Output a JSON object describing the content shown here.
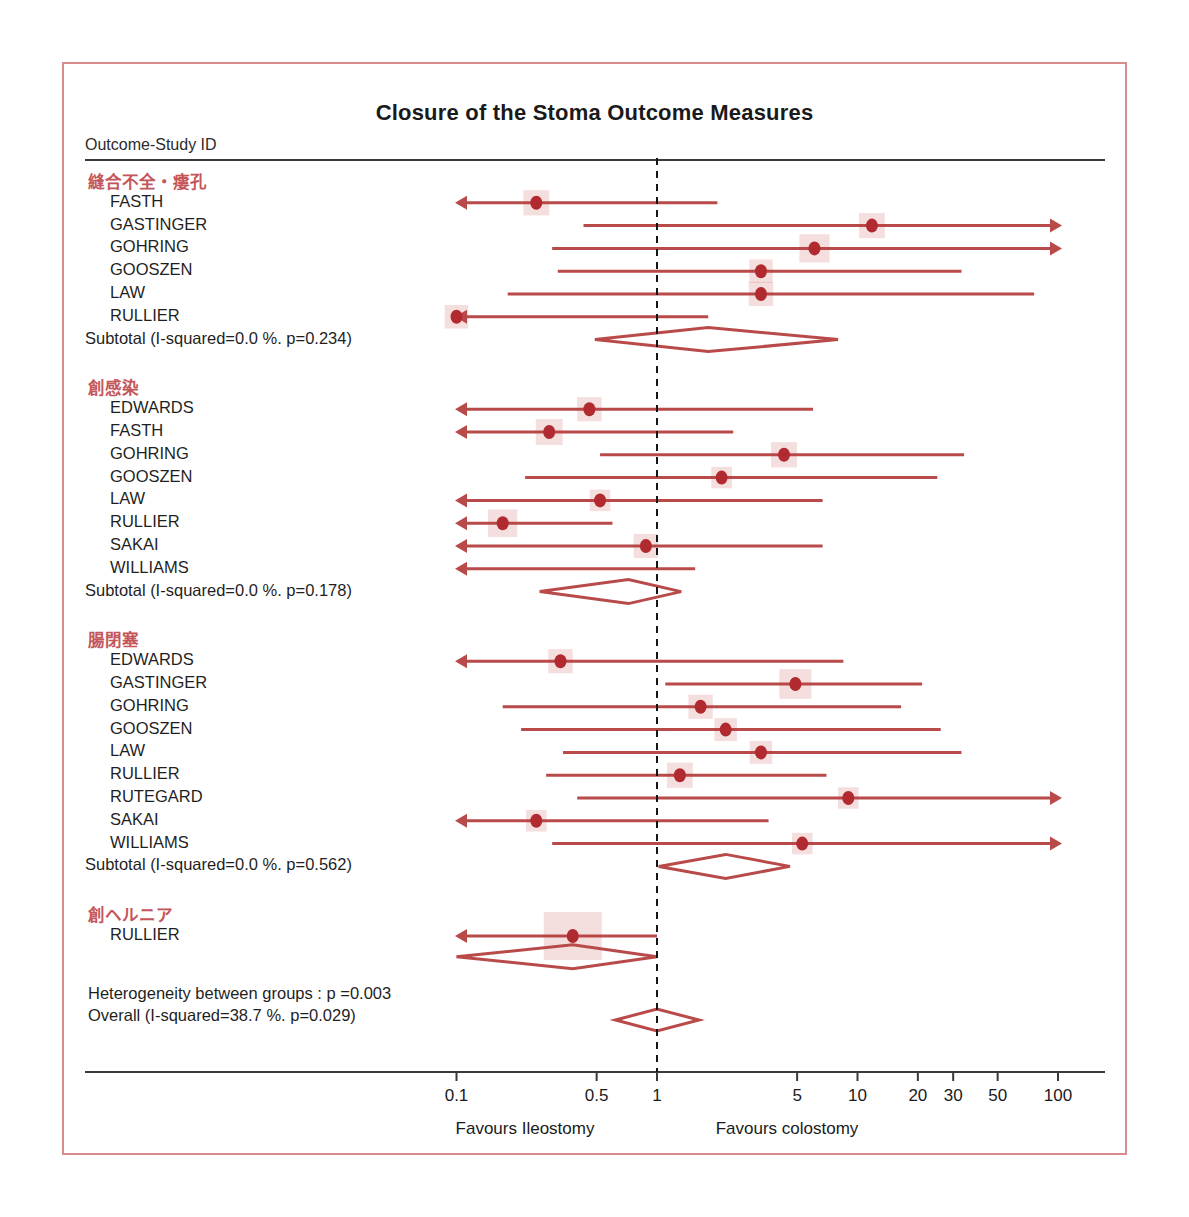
{
  "figure": {
    "title": "Closure of the Stoma Outcome Measures",
    "column_header": "Outcome-Study ID",
    "heterogeneity_note": "Heterogeneity between groups : p =0.003",
    "overall_label": "Overall (I-squared=38.7 %. p=0.029)",
    "favours_left": "Favours Ileostomy",
    "favours_right": "Favours colostomy",
    "accent_color": "#b94a4a",
    "marker_color": "#b02a30",
    "group_heading_color": "#c4565a",
    "frame_color": "#d98c8c"
  },
  "chart_data": {
    "type": "forest",
    "title": "Closure of the Stoma Outcome Measures",
    "xlabel": "Odds ratio (log scale)",
    "ylabel": "Outcome-Study ID",
    "scale": "log10",
    "xlim": [
      0.07,
      160
    ],
    "xticks": [
      0.1,
      0.5,
      1,
      5,
      10,
      20,
      30,
      50,
      100
    ],
    "xticklabels": [
      "0.1",
      "0.5",
      "1",
      "5",
      "10",
      "20",
      "30",
      "50",
      "100"
    ],
    "reference_line": 1,
    "grid": false,
    "legend": false,
    "groups": [
      {
        "name": "縫合不全・瘻孔",
        "studies": [
          {
            "label": "FASTH",
            "est": 0.25,
            "lo": 0.07,
            "hi": 2.0,
            "lo_clipped": true,
            "hi_clipped": false,
            "weight": 0.33
          },
          {
            "label": "GASTINGER",
            "est": 11.8,
            "lo": 0.43,
            "hi": 160,
            "lo_clipped": false,
            "hi_clipped": true,
            "weight": 0.33
          },
          {
            "label": "GOHRING",
            "est": 6.1,
            "lo": 0.3,
            "hi": 160,
            "lo_clipped": false,
            "hi_clipped": true,
            "weight": 0.42
          },
          {
            "label": "GOOSZEN",
            "est": 3.3,
            "lo": 0.32,
            "hi": 33.0,
            "lo_clipped": false,
            "hi_clipped": false,
            "weight": 0.28
          },
          {
            "label": "LAW",
            "est": 3.3,
            "lo": 0.18,
            "hi": 76.0,
            "lo_clipped": false,
            "hi_clipped": false,
            "weight": 0.3
          },
          {
            "label": "RULLIER",
            "est": 0.1,
            "lo": 0.07,
            "hi": 1.8,
            "lo_clipped": true,
            "hi_clipped": false,
            "weight": 0.28
          }
        ],
        "subtotal": {
          "label": "Subtotal (I-squared=0.0 %. p=0.234)",
          "est": 1.8,
          "lo": 0.49,
          "hi": 8.0,
          "i_squared": "0.0 %",
          "p": "0.234"
        }
      },
      {
        "name": "創感染",
        "studies": [
          {
            "label": "EDWARDS",
            "est": 0.46,
            "lo": 0.07,
            "hi": 6.0,
            "lo_clipped": true,
            "hi_clipped": false,
            "weight": 0.3
          },
          {
            "label": "FASTH",
            "est": 0.29,
            "lo": 0.07,
            "hi": 2.4,
            "lo_clipped": true,
            "hi_clipped": false,
            "weight": 0.35
          },
          {
            "label": "GOHRING",
            "est": 4.3,
            "lo": 0.52,
            "hi": 34.0,
            "lo_clipped": false,
            "hi_clipped": false,
            "weight": 0.33
          },
          {
            "label": "GOOSZEN",
            "est": 2.1,
            "lo": 0.22,
            "hi": 25.0,
            "lo_clipped": false,
            "hi_clipped": false,
            "weight": 0.22
          },
          {
            "label": "LAW",
            "est": 0.52,
            "lo": 0.07,
            "hi": 6.7,
            "lo_clipped": true,
            "hi_clipped": false,
            "weight": 0.22
          },
          {
            "label": "RULLIER",
            "est": 0.17,
            "lo": 0.07,
            "hi": 0.6,
            "lo_clipped": true,
            "hi_clipped": false,
            "weight": 0.4
          },
          {
            "label": "SAKAI",
            "est": 0.88,
            "lo": 0.07,
            "hi": 6.7,
            "lo_clipped": true,
            "hi_clipped": false,
            "weight": 0.3
          },
          {
            "label": "WILLIAMS",
            "est": null,
            "lo": 0.07,
            "hi": 1.55,
            "lo_clipped": true,
            "hi_clipped": false,
            "weight": 0.0
          }
        ],
        "subtotal": {
          "label": "Subtotal (I-squared=0.0 %. p=0.178)",
          "est": 0.72,
          "lo": 0.26,
          "hi": 1.32,
          "i_squared": "0.0 %",
          "p": "0.178"
        }
      },
      {
        "name": "腸閉塞",
        "studies": [
          {
            "label": "EDWARDS",
            "est": 0.33,
            "lo": 0.07,
            "hi": 8.5,
            "lo_clipped": true,
            "hi_clipped": false,
            "weight": 0.3
          },
          {
            "label": "GASTINGER",
            "est": 4.9,
            "lo": 1.1,
            "hi": 21.0,
            "lo_clipped": false,
            "hi_clipped": false,
            "weight": 0.46
          },
          {
            "label": "GOHRING",
            "est": 1.65,
            "lo": 0.17,
            "hi": 16.5,
            "lo_clipped": false,
            "hi_clipped": false,
            "weight": 0.3
          },
          {
            "label": "GOOSZEN",
            "est": 2.2,
            "lo": 0.21,
            "hi": 26.0,
            "lo_clipped": false,
            "hi_clipped": false,
            "weight": 0.26
          },
          {
            "label": "LAW",
            "est": 3.3,
            "lo": 0.34,
            "hi": 33.0,
            "lo_clipped": false,
            "hi_clipped": false,
            "weight": 0.26
          },
          {
            "label": "RULLIER",
            "est": 1.3,
            "lo": 0.28,
            "hi": 7.0,
            "lo_clipped": false,
            "hi_clipped": false,
            "weight": 0.33
          },
          {
            "label": "RUTEGARD",
            "est": 9.0,
            "lo": 0.4,
            "hi": 160,
            "lo_clipped": false,
            "hi_clipped": true,
            "weight": 0.22
          },
          {
            "label": "SAKAI",
            "est": 0.25,
            "lo": 0.07,
            "hi": 3.6,
            "lo_clipped": true,
            "hi_clipped": false,
            "weight": 0.22
          },
          {
            "label": "WILLIAMS",
            "est": 5.3,
            "lo": 0.3,
            "hi": 160,
            "lo_clipped": false,
            "hi_clipped": true,
            "weight": 0.22
          }
        ],
        "subtotal": {
          "label": "Subtotal (I-squared=0.0 %. p=0.562)",
          "est": 2.2,
          "lo": 1.02,
          "hi": 4.6,
          "i_squared": "0.0 %",
          "p": "0.562"
        }
      },
      {
        "name": "創ヘルニア",
        "studies": [
          {
            "label": "RULLIER",
            "est": 0.38,
            "lo": 0.07,
            "hi": 1.0,
            "lo_clipped": true,
            "hi_clipped": false,
            "weight": 1.0
          }
        ],
        "subtotal": {
          "label": "",
          "est": 0.38,
          "lo": 0.1,
          "hi": 1.0,
          "i_squared": "",
          "p": ""
        }
      }
    ],
    "overall": {
      "label": "Overall (I-squared=38.7 %. p=0.029)",
      "est": 1.0,
      "lo": 0.62,
      "hi": 1.62,
      "i_squared": "38.7 %",
      "p": "0.029"
    },
    "heterogeneity_between_groups_p": "0.003"
  }
}
